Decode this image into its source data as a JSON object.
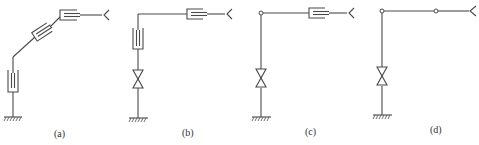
{
  "figure": {
    "panels": [
      {
        "id": "a",
        "label": "(a)",
        "description": "Arm with vertical prismatic joint, inclined prismatic joint and horizontal prismatic joint ending in gripper"
      },
      {
        "id": "b",
        "label": "(b)",
        "description": "Arm with revolute base joint, vertical prismatic joint and horizontal prismatic joint ending in gripper"
      },
      {
        "id": "c",
        "label": "(c)",
        "description": "Arm with revolute base joint, pin joint at elbow and horizontal prismatic joint ending in gripper"
      },
      {
        "id": "d",
        "label": "(d)",
        "description": "Arm with revolute base joint and two pin joints ending in gripper"
      }
    ],
    "colors": {
      "line": "#4a4a4a",
      "background": "#ffffff",
      "label": "#333333"
    },
    "symbols": [
      "ground-hatch",
      "prismatic-joint",
      "revolute-joint-bowtie",
      "pin-joint-circle",
      "gripper"
    ]
  }
}
